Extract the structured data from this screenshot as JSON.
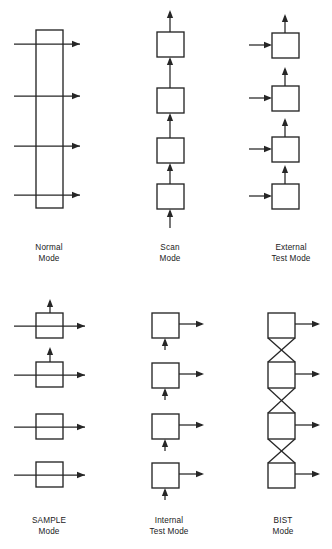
{
  "figure": {
    "background_color": "#ffffff",
    "line_color": "#262626",
    "box_fill": "#ffffff",
    "width": 332,
    "height": 549,
    "panel_count": 6,
    "cells_per_panel": 4
  },
  "panels": [
    {
      "id": "normal-mode",
      "label_line1": "Normal",
      "label_line2": "Mode",
      "label_full": "Normal Mode",
      "description": "One tall register rectangle with four horizontal signal paths passing straight through it",
      "shape": "single-tall-rectangle",
      "signal_arrows": 4,
      "arrow_direction": "left-to-right",
      "vertical_arrows": 0,
      "cross_links": 0
    },
    {
      "id": "scan-mode",
      "label_line1": "Scan",
      "label_line2": "Mode",
      "label_full": "Scan Mode",
      "description": "Four stacked cells chained bottom to top by upward arrows, input at bottom and output at top",
      "shape": "four-stacked-cells",
      "signal_arrows": 0,
      "arrow_direction": "bottom-to-top",
      "vertical_arrows": 5,
      "cross_links": 0
    },
    {
      "id": "external-test-mode",
      "label_line1": "External",
      "label_line2": "Test Mode",
      "label_full": "External Test Mode",
      "description": "Four separate cells, each driven by an arrow from the left and each emitting an arrow upward",
      "shape": "four-separate-cells",
      "signal_arrows": 4,
      "arrow_direction": "left-in-up-out",
      "vertical_arrows": 4,
      "cross_links": 0
    },
    {
      "id": "sample-mode",
      "label_line1": "SAMPLE",
      "label_line2": "Mode",
      "label_full": "SAMPLE Mode",
      "description": "Four cells with signals passing straight through left to right; upper two cells also tap a sample upward",
      "shape": "four-separate-cells",
      "signal_arrows": 4,
      "arrow_direction": "left-to-right",
      "vertical_arrows": 2,
      "cross_links": 0
    },
    {
      "id": "internal-test-mode",
      "label_line1": "Internal",
      "label_line2": "Test Mode",
      "label_full": "Internal Test Mode",
      "description": "Four cells each receiving a short upward arrow from below and driving an arrow out to the right",
      "shape": "four-separate-cells",
      "signal_arrows": 4,
      "arrow_direction": "up-in-right-out",
      "vertical_arrows": 4,
      "cross_links": 0
    },
    {
      "id": "bist-mode",
      "label_line1": "BIST",
      "label_line2": "Mode",
      "label_full": "BIST Mode",
      "description": "Four cells linked vertically by crossed X connections, each driving an arrow out to the right",
      "shape": "four-cells-crossed-chain",
      "signal_arrows": 4,
      "arrow_direction": "left-to-right-out",
      "vertical_arrows": 0,
      "cross_links": 3
    }
  ]
}
